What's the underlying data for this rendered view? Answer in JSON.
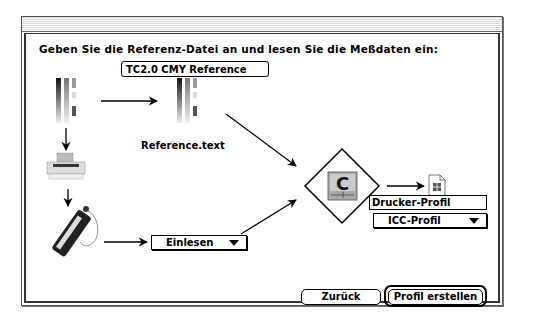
{
  "dialog": {
    "instruction": "Geben Sie die Referenz-Datei an und lesen Sie die Meßdaten ein:",
    "reference_field_value": "TC2.0 CMY Reference",
    "reference_file_label": "Reference.text",
    "read_popup": {
      "selected": "Einlesen"
    },
    "profile_name_field_value": "Drucker-Profil",
    "profile_format_popup": {
      "selected": "ICC-Profil"
    },
    "buttons": {
      "back_label": "Zurück",
      "create_label": "Profil erstellen"
    }
  },
  "icons": {
    "test_chart": "color-test-chart-icon",
    "reference_chart": "reference-chart-icon",
    "printer": "printer-icon",
    "spectrophotometer": "measuring-device-icon",
    "colorsync_app": "colorsync-app-icon",
    "profile_document": "profile-document-icon"
  }
}
